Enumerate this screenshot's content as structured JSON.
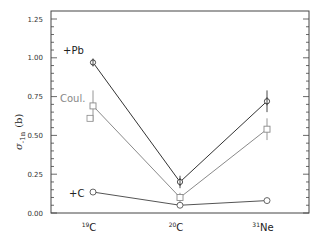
{
  "chart_data": {
    "type": "line",
    "title": "",
    "xlabel": "",
    "ylabel": "σ-1n (b)",
    "ylabel_main": "σ",
    "ylabel_sub": "-1n",
    "ylabel_unit": "(b)",
    "ylim": [
      0,
      1.25
    ],
    "yticks": [
      "0.00",
      "0.25",
      "0.50",
      "0.75",
      "1.00",
      "1.25"
    ],
    "ytick_values": [
      0,
      0.25,
      0.5,
      0.75,
      1.0,
      1.25
    ],
    "grid": false,
    "legend_position": "inline-left",
    "categories": [
      {
        "mass": "19",
        "element": "C"
      },
      {
        "mass": "20",
        "element": "C"
      },
      {
        "mass": "31",
        "element": "Ne"
      }
    ],
    "series": [
      {
        "name": "+Pb",
        "marker": "diamond-cross",
        "color": "#333333",
        "values": [
          0.97,
          0.2,
          0.72
        ],
        "errors": [
          0.02,
          0.04,
          0.07
        ]
      },
      {
        "name": "Coul.",
        "marker": "square",
        "color": "#8a8a8a",
        "values": [
          0.69,
          0.1,
          0.54
        ],
        "errors": [
          0.1,
          0.03,
          0.07
        ],
        "extra_points": [
          {
            "category_index": 0,
            "value": 0.61
          }
        ]
      },
      {
        "name": "+C",
        "marker": "circle",
        "color": "#555555",
        "values": [
          0.135,
          0.05,
          0.08
        ],
        "errors": [
          0.01,
          0.01,
          0.01
        ]
      }
    ]
  }
}
